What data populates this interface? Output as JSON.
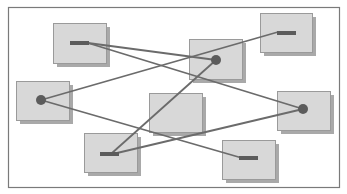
{
  "diagram": {
    "title": "",
    "colors": {
      "background": "#ffffff",
      "frame": "#7a7a7a",
      "box_fill": "#d8d8d8",
      "box_border": "#9a9a9a",
      "box_shadow": "#a9a9a9",
      "marker": "#5c5c5c",
      "line": "#6b6b6b"
    },
    "frame": {
      "x": 8,
      "y": 7,
      "w": 331,
      "h": 180
    },
    "nodes": [
      {
        "id": "n1",
        "x": 53,
        "y": 23,
        "w": 53,
        "h": 40,
        "marker": "bar",
        "mx": 70,
        "my": 41
      },
      {
        "id": "n2",
        "x": 16,
        "y": 81,
        "w": 53,
        "h": 39,
        "marker": "dot",
        "mx": 41,
        "my": 100
      },
      {
        "id": "n3",
        "x": 189,
        "y": 39,
        "w": 53,
        "h": 40,
        "marker": "dot",
        "mx": 216,
        "my": 60
      },
      {
        "id": "n4",
        "x": 260,
        "y": 13,
        "w": 52,
        "h": 39,
        "marker": "bar",
        "mx": 277,
        "my": 31
      },
      {
        "id": "n5",
        "x": 277,
        "y": 91,
        "w": 53,
        "h": 39,
        "marker": "dot",
        "mx": 303,
        "my": 109
      },
      {
        "id": "n6",
        "x": 149,
        "y": 93,
        "w": 53,
        "h": 39,
        "marker": "none",
        "mx": 0,
        "my": 0
      },
      {
        "id": "n7",
        "x": 84,
        "y": 133,
        "w": 53,
        "h": 39,
        "marker": "bar",
        "mx": 100,
        "my": 152
      },
      {
        "id": "n8",
        "x": 222,
        "y": 140,
        "w": 53,
        "h": 39,
        "marker": "bar",
        "mx": 239,
        "my": 156
      }
    ],
    "edges": [
      {
        "from": "n1",
        "to": "n3",
        "x1": 88,
        "y1": 43,
        "x2": 216,
        "y2": 60
      },
      {
        "from": "n1",
        "to": "n5",
        "x1": 88,
        "y1": 43,
        "x2": 303,
        "y2": 109
      },
      {
        "from": "n2",
        "to": "n4",
        "x1": 41,
        "y1": 100,
        "x2": 278,
        "y2": 32
      },
      {
        "from": "n2",
        "to": "n8",
        "x1": 41,
        "y1": 100,
        "x2": 242,
        "y2": 158
      },
      {
        "from": "n7",
        "to": "n3",
        "x1": 112,
        "y1": 153,
        "x2": 216,
        "y2": 60
      },
      {
        "from": "n7",
        "to": "n5",
        "x1": 117,
        "y1": 153,
        "x2": 303,
        "y2": 109
      }
    ]
  }
}
